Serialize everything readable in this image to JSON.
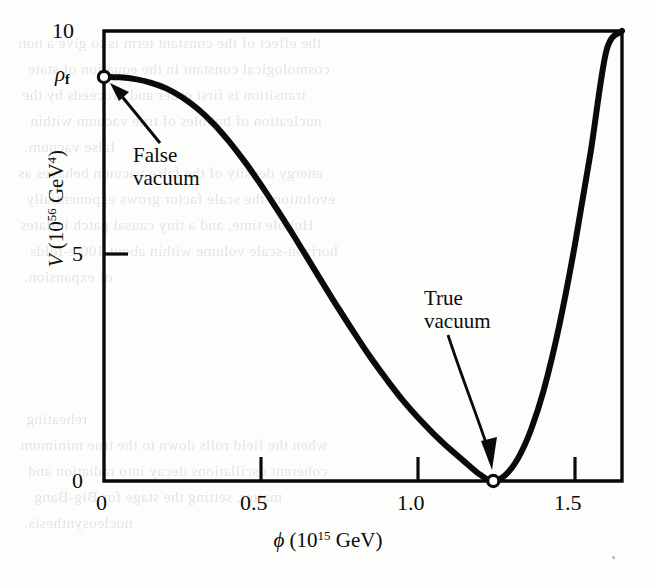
{
  "figure": {
    "kind": "scientific-plot",
    "caption_present": false
  },
  "axes": {
    "x": {
      "title_var": "ϕ",
      "title_units": "(10",
      "title_exp": "15",
      "title_tail": " GeV)",
      "ticks": [
        "0",
        "0.5",
        "1.0",
        "1.5"
      ],
      "tick_values": [
        0,
        0.5,
        1.0,
        1.5
      ],
      "range": [
        0,
        1.65
      ]
    },
    "y": {
      "title_var": "V",
      "title_units": "(10",
      "title_exp": "56",
      "title_tail": " GeV",
      "title_tail_exp": "4",
      "title_close": ")",
      "ticks": [
        "0",
        "5",
        "10"
      ],
      "tick_values": [
        0,
        5,
        10
      ],
      "range": [
        0,
        10
      ]
    }
  },
  "annotations": {
    "rho_f": {
      "symbol": "ρ",
      "subscript": "f",
      "meaning": "false-vacuum energy density"
    },
    "false_vacuum": {
      "line1": "False",
      "line2": "vacuum"
    },
    "true_vacuum": {
      "line1": "True",
      "line2": "vacuum"
    }
  },
  "colors": {
    "ink": "#0a0a0a",
    "paper": "#fdfdfb",
    "bleed": "#6f6a62"
  },
  "bleed_text": [
    {
      "t": "the effect of the constant term is to give a non",
      "x": 18,
      "y": 30
    },
    {
      "t": "cosmological constant in the equation of state",
      "x": 28,
      "y": 56
    },
    {
      "t": "transition is first order and proceeds by the",
      "x": 22,
      "y": 82
    },
    {
      "t": "nucleation of bubbles of true vacuum within",
      "x": 30,
      "y": 108
    },
    {
      "t": "false vacuum.",
      "x": 24,
      "y": 134
    },
    {
      "t": "energy density of the false vacuum behaves as",
      "x": 18,
      "y": 160
    },
    {
      "t": "evolution, the scale factor grows exponentially",
      "x": 26,
      "y": 186
    },
    {
      "t": "Hubble time, and a tiny causal patch inflates",
      "x": 20,
      "y": 212
    },
    {
      "t": "horizon-scale volume within about 100 e-folds",
      "x": 30,
      "y": 238
    },
    {
      "t": "of expansion.",
      "x": 24,
      "y": 264
    },
    {
      "t": "reheating",
      "x": 26,
      "y": 406
    },
    {
      "t": "when the field rolls down to the true minimum",
      "x": 20,
      "y": 432
    },
    {
      "t": "coherent oscillations decay into radiation and",
      "x": 28,
      "y": 458
    },
    {
      "t": "matter, setting the stage for Big-Bang",
      "x": 34,
      "y": 484
    },
    {
      "t": "nucleosynthesis.",
      "x": 24,
      "y": 510
    }
  ],
  "chart_data": {
    "type": "line",
    "title": "",
    "xlabel": "ϕ (10^15 GeV)",
    "ylabel": "V (10^56 GeV^4)",
    "xlim": [
      0,
      1.65
    ],
    "ylim": [
      0,
      10
    ],
    "xticks": [
      0,
      0.5,
      1.0,
      1.5
    ],
    "yticks": [
      0,
      5,
      10
    ],
    "grid": false,
    "legend": null,
    "series": [
      {
        "name": "Effective potential V(ϕ)",
        "x": [
          0.0,
          0.05,
          0.1,
          0.15,
          0.2,
          0.25,
          0.3,
          0.35,
          0.4,
          0.45,
          0.5,
          0.55,
          0.6,
          0.65,
          0.7,
          0.75,
          0.8,
          0.85,
          0.9,
          0.95,
          1.0,
          1.05,
          1.1,
          1.15,
          1.2,
          1.24,
          1.28,
          1.32,
          1.36,
          1.4,
          1.45,
          1.5,
          1.55,
          1.6,
          1.65
        ],
        "y": [
          8.98,
          8.97,
          8.93,
          8.85,
          8.72,
          8.52,
          8.26,
          7.93,
          7.53,
          7.08,
          6.58,
          6.05,
          5.5,
          4.93,
          4.36,
          3.8,
          3.26,
          2.74,
          2.26,
          1.81,
          1.41,
          1.05,
          0.72,
          0.42,
          0.13,
          0.0,
          0.14,
          0.52,
          1.14,
          2.0,
          3.45,
          5.25,
          7.3,
          9.55,
          10.0
        ]
      }
    ],
    "markers": [
      {
        "label": "False vacuum",
        "x": 0.0,
        "y": 8.98,
        "style": "open-circle"
      },
      {
        "label": "True vacuum",
        "x": 1.24,
        "y": 0.0,
        "style": "open-circle"
      }
    ],
    "annotations": [
      {
        "text": "ρ_f",
        "x": -0.09,
        "y": 8.98,
        "role": "axis-symbol"
      },
      {
        "text": "False vacuum",
        "x": 0.12,
        "y": 7.55,
        "role": "callout",
        "arrow_to": [
          0.02,
          8.88
        ]
      },
      {
        "text": "True vacuum",
        "x": 1.04,
        "y": 4.4,
        "role": "callout",
        "arrow_to": [
          1.24,
          0.18
        ]
      }
    ]
  }
}
